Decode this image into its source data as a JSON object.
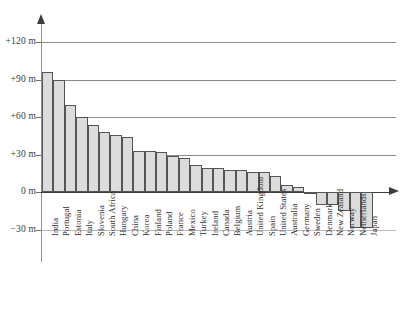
{
  "chart_data": {
    "type": "bar",
    "title": "",
    "subtitle": "",
    "xlabel": "",
    "ylabel": "",
    "ylim": [
      -30,
      130
    ],
    "grid": true,
    "legend": null,
    "orientation": "vertical",
    "unit": "m",
    "y_ticks": [
      {
        "value": 120,
        "label": "+120 m"
      },
      {
        "value": 90,
        "label": "+90 m"
      },
      {
        "value": 60,
        "label": "+60 m"
      },
      {
        "value": 30,
        "label": "+30 m"
      },
      {
        "value": 0,
        "label": "0 m"
      },
      {
        "value": -30,
        "label": "−30 m"
      }
    ],
    "categories": [
      "India",
      "Portugal",
      "Estonia",
      "Italy",
      "Slovenia",
      "South Africa",
      "Hungary",
      "China",
      "Korea",
      "Finland",
      "Poland",
      "France",
      "Mexico",
      "Turkey",
      "Ireland",
      "Canada",
      "Belgium",
      "Austria",
      "United Kingdom",
      "Spain",
      "United States",
      "Australia",
      "Germany",
      "Sweden",
      "Denmark",
      "New Zealand",
      "Norway",
      "Netherlands",
      "Japan"
    ],
    "values": [
      96,
      90,
      70,
      60,
      54,
      48,
      46,
      44,
      33,
      33,
      32,
      29,
      27,
      22,
      19,
      19,
      18,
      18,
      16,
      16,
      13,
      6,
      4,
      -1,
      -10,
      -10,
      -15,
      -29,
      -29
    ]
  },
  "axis": {
    "vertical_arrow_icon": "axis-arrow-up",
    "horizontal_arrow_icon": "axis-arrow-right"
  }
}
